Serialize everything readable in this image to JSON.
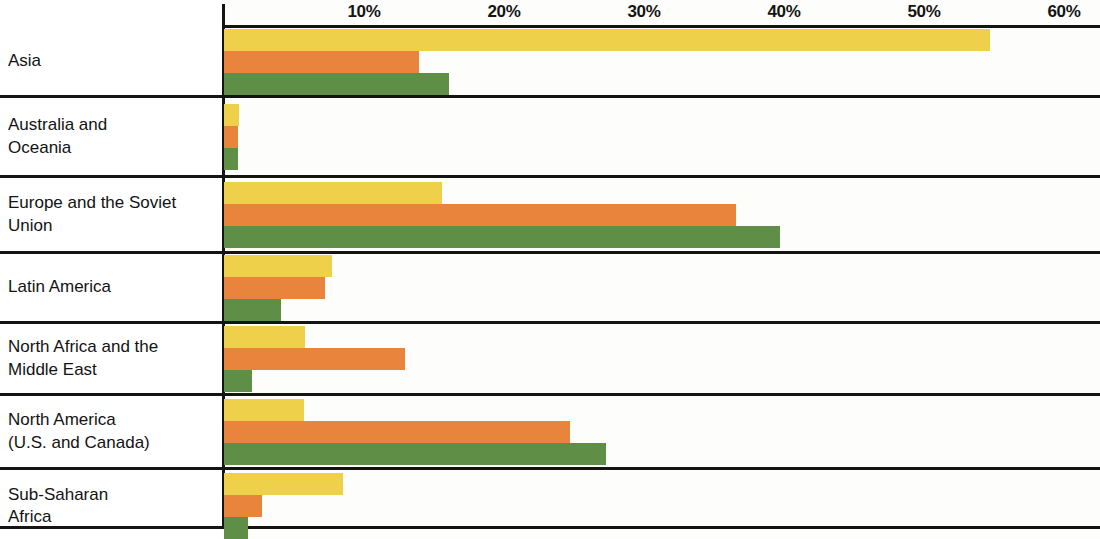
{
  "chart_data": {
    "type": "bar",
    "orientation": "horizontal",
    "title": "",
    "subtitle": "",
    "xlabel": "",
    "ylabel": "",
    "xlim": [
      0,
      62
    ],
    "grid": false,
    "legend": "none",
    "axis_tick_labels": [
      "10%",
      "20%",
      "30%",
      "40%",
      "50%",
      "60%"
    ],
    "axis_tick_values": [
      10,
      20,
      30,
      40,
      50,
      60
    ],
    "categories": [
      "Asia",
      "Australia and\nOceania",
      "Europe and the Soviet\nUnion",
      "Latin America",
      "North Africa and the\nMiddle East",
      "North America\n(U.S. and Canada)",
      "Sub-Saharan\nAfrica"
    ],
    "series": [
      {
        "name": "series-1",
        "color": "#efd04a",
        "values": [
          54.7,
          1.1,
          15.6,
          7.7,
          5.8,
          5.7,
          8.5
        ]
      },
      {
        "name": "series-2",
        "color": "#e8843c",
        "values": [
          13.9,
          1.0,
          36.6,
          7.2,
          12.9,
          24.7,
          2.7
        ]
      },
      {
        "name": "series-3",
        "color": "#5f8f46",
        "values": [
          16.1,
          1.0,
          39.7,
          4.1,
          2.0,
          27.3,
          1.7
        ]
      }
    ],
    "row_heights_px": [
      70,
      80,
      76,
      70,
      72,
      74,
      72
    ]
  }
}
